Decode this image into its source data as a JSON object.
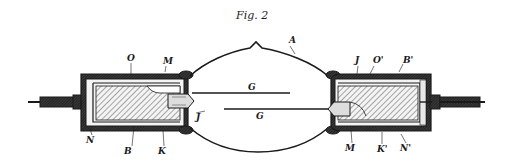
{
  "figure": {
    "title": "Fig. 2"
  },
  "colors": {
    "ink": "#1a1a1a",
    "background": "#ffffff",
    "hatch": "#555555"
  },
  "labels": {
    "O": "O",
    "M_top": "M",
    "A": "A",
    "J_top": "J",
    "O_prime": "O'",
    "B_prime": "B'",
    "G_upper": "G",
    "G_lower": "G",
    "J_mid": "J",
    "N": "N",
    "B": "B",
    "K": "K",
    "M_bottom": "M",
    "K_prime": "K'",
    "N_prime": "N'"
  }
}
